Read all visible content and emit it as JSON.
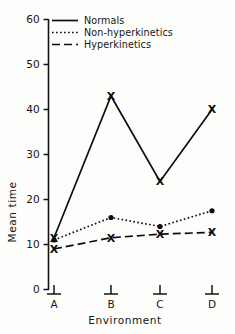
{
  "chart_data": {
    "type": "line",
    "title": "",
    "xlabel": "Environment",
    "ylabel": "Mean time",
    "categories": [
      "A",
      "B",
      "C",
      "D"
    ],
    "ylim": [
      0,
      60
    ],
    "yticks": [
      0,
      10,
      20,
      30,
      40,
      50,
      60
    ],
    "ytick_labels": [
      "0",
      "10",
      "20",
      "30",
      "40",
      "50",
      "60"
    ],
    "grid": false,
    "legend_position": "top-right-inside",
    "series": [
      {
        "name": "Normals",
        "values": [
          11.5,
          43.0,
          24.0,
          40.0
        ],
        "line_style": "solid",
        "marker": "X",
        "color": "#0d0d0d"
      },
      {
        "name": "Non-hyperkinetics",
        "values": [
          11.0,
          16.0,
          14.0,
          17.5
        ],
        "line_style": "dotted",
        "marker": "dot",
        "color": "#0d0d0d"
      },
      {
        "name": "Hyperkinetics",
        "values": [
          9.0,
          11.5,
          12.3,
          12.7
        ],
        "line_style": "dashed",
        "marker": "X",
        "color": "#0d0d0d"
      }
    ]
  },
  "axes": {
    "y_title": "Mean time",
    "x_title": "Environment",
    "y_tick_0": "0",
    "y_tick_1": "10",
    "y_tick_2": "20",
    "y_tick_3": "30",
    "y_tick_4": "40",
    "y_tick_5": "50",
    "y_tick_6": "60",
    "x_cat_0": "A",
    "x_cat_1": "B",
    "x_cat_2": "C",
    "x_cat_3": "D"
  },
  "legend": {
    "entries": [
      {
        "label": "Normals",
        "style": "solid"
      },
      {
        "label": "Non-hyperkinetics",
        "style": "dotted"
      },
      {
        "label": "Hyperkinetics",
        "style": "dashed"
      }
    ],
    "entry_0_label": "Normals",
    "entry_1_label": "Non-hyperkinetics",
    "entry_2_label": "Hyperkinetics"
  }
}
